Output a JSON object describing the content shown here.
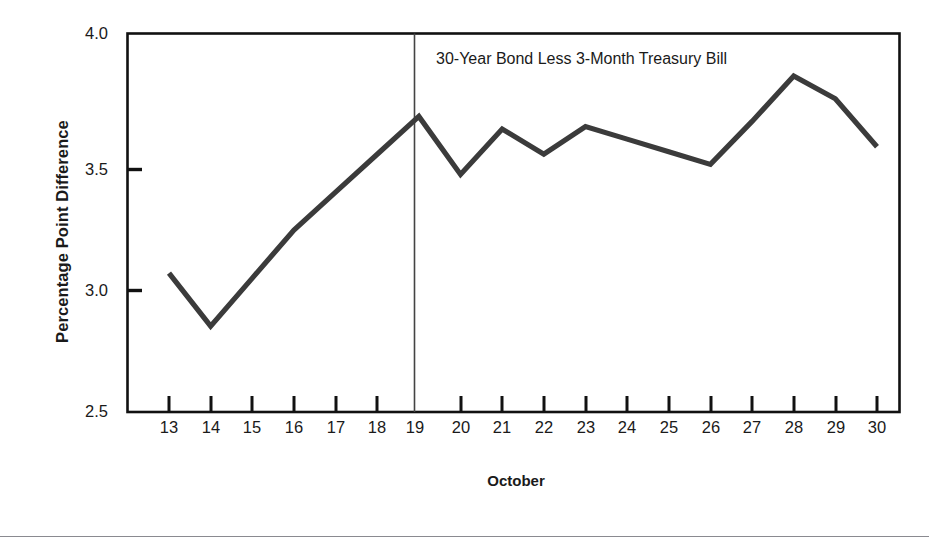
{
  "figure": {
    "background_color": "#ffffff",
    "line_color": "#3b3b3b",
    "axis_color": "#111111",
    "marker_line_color": "#444444",
    "bottom_rule_color": "#8a8a90"
  },
  "chart_data": {
    "type": "line",
    "title": "",
    "annotation": "30-Year Bond Less 3-Month Treasury Bill",
    "xlabel": "October",
    "ylabel": "Percentage Point Difference",
    "categories": [
      "13",
      "14",
      "15",
      "16",
      "17",
      "18",
      "19",
      "20",
      "21",
      "22",
      "23",
      "24",
      "25",
      "26",
      "27",
      "28",
      "29",
      "30"
    ],
    "x": [
      13,
      14,
      15,
      16,
      17,
      18,
      19,
      20,
      21,
      22,
      23,
      24,
      25,
      26,
      27,
      28,
      29,
      30
    ],
    "values": [
      3.05,
      2.84,
      3.03,
      3.22,
      3.37,
      3.52,
      3.67,
      3.44,
      3.62,
      3.52,
      3.63,
      3.58,
      3.53,
      3.48,
      3.65,
      3.83,
      3.74,
      3.55
    ],
    "series": [
      {
        "name": "30-Year Bond Less 3-Month Treasury Bill",
        "values": [
          3.05,
          2.84,
          3.03,
          3.22,
          3.37,
          3.52,
          3.67,
          3.44,
          3.62,
          3.52,
          3.63,
          3.58,
          3.53,
          3.48,
          3.65,
          3.83,
          3.74,
          3.55
        ]
      }
    ],
    "ylim": [
      2.5,
      4.0
    ],
    "ytick_labels": [
      "4.0",
      "3.5",
      "3.0",
      "2.5"
    ],
    "ytick_values": [
      4.0,
      3.5,
      3.0,
      2.5
    ],
    "xlim": [
      12.5,
      30.5
    ],
    "grid": false,
    "legend": "none",
    "vertical_marker": {
      "x": 19,
      "label": ""
    }
  }
}
